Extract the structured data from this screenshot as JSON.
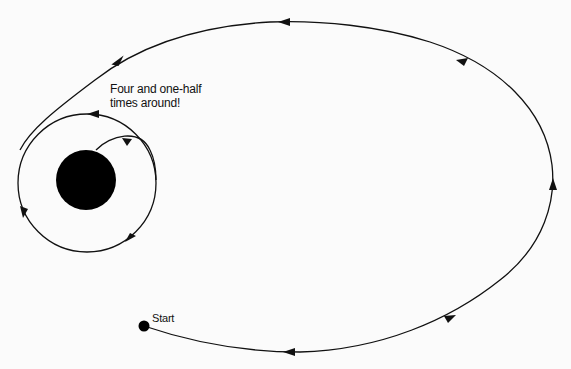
{
  "diagram": {
    "annotation_line1": "Four and one-half",
    "annotation_line2": "times around!",
    "start_label": "Start",
    "elements": {
      "central_body": "black filled disc (planet)",
      "inner_orbit": "circular parking orbit around central body",
      "outer_orbit": "large elliptical transfer orbit",
      "start_point": "black dot marking start"
    },
    "colors": {
      "line": "#111111",
      "body": "#000000",
      "background": "#fbfbfb"
    }
  }
}
